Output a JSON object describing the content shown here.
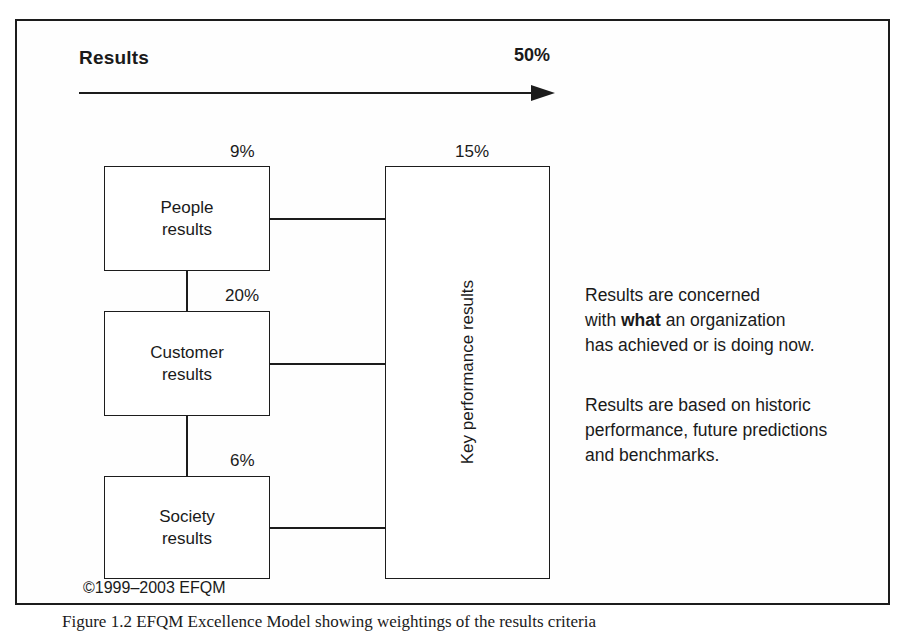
{
  "figure": {
    "header": {
      "title": "Results",
      "weight": "50%",
      "arrow_icon": "right-arrow-icon"
    },
    "boxes": [
      {
        "id": "people",
        "label": "People\nresults",
        "weight": "9%"
      },
      {
        "id": "customer",
        "label": "Customer\nresults",
        "weight": "20%"
      },
      {
        "id": "society",
        "label": "Society\nresults",
        "weight": "6%"
      },
      {
        "id": "kpr",
        "label": "Key performance results",
        "weight": "15%"
      }
    ],
    "notes": [
      {
        "before": "Results are concerned\nwith ",
        "emphasis": "what",
        "after": " an organization\nhas achieved or is doing now."
      },
      {
        "text": "Results are based on historic\nperformance, future predictions\nand benchmarks."
      }
    ],
    "copyright": "©1999–2003 EFQM",
    "caption": "Figure 1.2  EFQM Excellence Model showing weightings of the results criteria"
  },
  "colors": {
    "line": "#1c1c1c",
    "text": "#1a1a1a",
    "background": "#ffffff"
  }
}
